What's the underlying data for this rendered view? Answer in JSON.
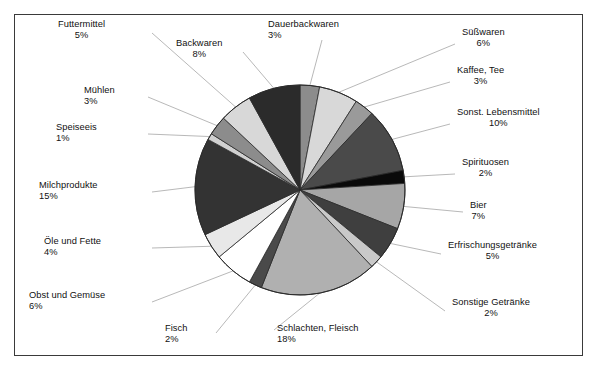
{
  "chart_data": {
    "type": "pie",
    "title": "",
    "subtitle": "",
    "xlabel": "",
    "ylabel": "",
    "legend_position": "none",
    "grid": false,
    "start_angle_deg": 0,
    "direction": "clockwise",
    "unit": "%",
    "categories": [
      "Dauerbackwaren",
      "Süßwaren",
      "Kaffee, Tee",
      "Sonst. Lebensmittel",
      "Spirituosen",
      "Bier",
      "Erfrischungsgetränke",
      "Sonstige Getränke",
      "Schlachten, Fleisch",
      "Fisch",
      "Obst und Gemüse",
      "Öle und Fette",
      "Milchprodukte",
      "Speiseeis",
      "Mühlen",
      "Futtermittel",
      "Backwaren"
    ],
    "values": [
      3,
      6,
      3,
      10,
      2,
      7,
      5,
      2,
      18,
      2,
      6,
      4,
      15,
      1,
      3,
      5,
      8
    ],
    "slice_colors": [
      "#8c8c8c",
      "#d8d8d8",
      "#9a9a9a",
      "#4a4a4a",
      "#0a0a0a",
      "#a6a6a6",
      "#3f3f3f",
      "#c9c9c9",
      "#b0b0b0",
      "#4a4a4a",
      "#ffffff",
      "#e8e8e8",
      "#333333",
      "#d0d0d0",
      "#8c8c8c",
      "#d8d8d8",
      "#2b2b2b"
    ]
  },
  "labels": [
    {
      "name": "Futtermittel",
      "pct": "5%"
    },
    {
      "name": "Backwaren",
      "pct": "8%"
    },
    {
      "name": "Dauerbackwaren",
      "pct": "3%"
    },
    {
      "name": "Süßwaren",
      "pct": "6%"
    },
    {
      "name": "Kaffee, Tee",
      "pct": "3%"
    },
    {
      "name": "Sonst. Lebensmittel",
      "pct": "10%"
    },
    {
      "name": "Spirituosen",
      "pct": "2%"
    },
    {
      "name": "Bier",
      "pct": "7%"
    },
    {
      "name": "Erfrischungsgetränke",
      "pct": "5%"
    },
    {
      "name": "Sonstige Getränke",
      "pct": "2%"
    },
    {
      "name": "Schlachten, Fleisch",
      "pct": "18%"
    },
    {
      "name": "Fisch",
      "pct": "2%"
    },
    {
      "name": "Obst und Gemüse",
      "pct": "6%"
    },
    {
      "name": "Öle und Fette",
      "pct": "4%"
    },
    {
      "name": "Milchprodukte",
      "pct": "15%"
    },
    {
      "name": "Speiseeis",
      "pct": "1%"
    },
    {
      "name": "Mühlen",
      "pct": "3%"
    }
  ],
  "style": {
    "frame_border_color": "#3a3a3a",
    "leader_line_color": "#9a9a9a",
    "pie_outline_color": "#2a2a2a",
    "background": "#ffffff",
    "text_color": "#111111"
  }
}
